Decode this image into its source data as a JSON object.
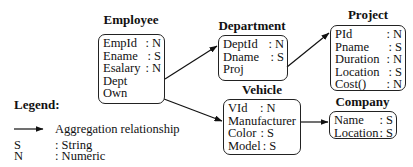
{
  "classes": [
    {
      "id": "employee",
      "title": "Employee",
      "attributes": [
        {
          "name": "EmpId",
          "type": ": N"
        },
        {
          "name": "Ename",
          "type": ": S"
        },
        {
          "name": "Esalary",
          "type": ": N"
        },
        {
          "name": "Dept",
          "type": ""
        },
        {
          "name": "Own",
          "type": ""
        }
      ]
    },
    {
      "id": "department",
      "title": "Department",
      "attributes": [
        {
          "name": "DeptId",
          "type": ": N"
        },
        {
          "name": "Dname",
          "type": ": S"
        },
        {
          "name": "Proj",
          "type": ""
        }
      ]
    },
    {
      "id": "project",
      "title": "Project",
      "attributes": [
        {
          "name": "PId",
          "type": ": N"
        },
        {
          "name": "Pname",
          "type": ": S"
        },
        {
          "name": "Duration",
          "type": ": N"
        },
        {
          "name": "Location",
          "type": ": S"
        },
        {
          "name": "Cost()",
          "type": ": N"
        }
      ]
    },
    {
      "id": "vehicle",
      "title": "Vehicle",
      "attributes": [
        {
          "name": "VId",
          "type": ": N"
        },
        {
          "name": "Manufacturer",
          "type": ""
        },
        {
          "name": "Color",
          "type": ": S"
        },
        {
          "name": "Model",
          "type": ": S"
        }
      ]
    },
    {
      "id": "company",
      "title": "Company",
      "attributes": [
        {
          "name": "Name",
          "type": ": S"
        },
        {
          "name": "Location",
          "type": ": S"
        }
      ]
    }
  ],
  "relationships": [
    {
      "from": "Employee.Dept",
      "to": "Department",
      "kind": "aggregation"
    },
    {
      "from": "Employee.Own",
      "to": "Vehicle",
      "kind": "aggregation"
    },
    {
      "from": "Department.Proj",
      "to": "Project",
      "kind": "aggregation"
    },
    {
      "from": "Vehicle.Manufacturer",
      "to": "Company",
      "kind": "aggregation"
    }
  ],
  "legend": {
    "title": "Legend:",
    "arrow_label": "Aggregation relationship",
    "entries": [
      {
        "key": "S",
        "value": ": String"
      },
      {
        "key": "N",
        "value": ": Numeric"
      }
    ]
  }
}
